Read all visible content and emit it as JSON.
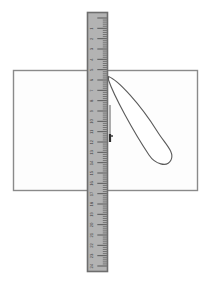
{
  "scene": {
    "title": "Ruler and pen drawing a line on paper",
    "width": 211,
    "height": 289,
    "background_color": "#ffffff"
  },
  "paper": {
    "label": "sheet-of-paper",
    "x": 13,
    "y": 70,
    "width": 185,
    "height": 121,
    "fill_color": "#fdfdfd",
    "border_color": "#8a8a8a"
  },
  "ruler": {
    "label": "ruler",
    "x": 87,
    "y": 12,
    "width": 21,
    "height": 260,
    "fill_color": "#b3b3b3",
    "border_color": "#6e6e6e",
    "orientation": "vertical",
    "tick_color": "#4a4a4a",
    "number_color": "#3a3a3a",
    "numbers": [
      "1",
      "2",
      "3",
      "4",
      "5",
      "6",
      "7",
      "8",
      "9",
      "10",
      "11",
      "12",
      "13",
      "14",
      "15",
      "16",
      "17",
      "18",
      "19",
      "20",
      "21",
      "22",
      "23",
      "24"
    ],
    "minor_ticks_per_unit": 5
  },
  "pen": {
    "label": "pen",
    "outline_color": "#5a5a5a",
    "fill_color": "#ffffff",
    "tip_x": 108,
    "tip_y": 76,
    "end_x": 170,
    "end_y": 160
  },
  "drawn_line": {
    "label": "drawn-pencil-line",
    "x": 110,
    "y_start": 105,
    "y_end": 142,
    "color": "#4a4a4a",
    "tip_mark_color": "#2e2e2e"
  }
}
